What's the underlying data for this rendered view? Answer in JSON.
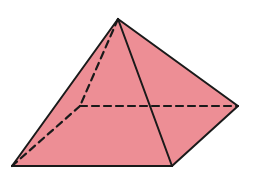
{
  "diagram": {
    "type": "square-pyramid",
    "colors": {
      "fill": "#ED8E95",
      "stroke": "#1a1a1a",
      "background": "#ffffff"
    },
    "vertices": {
      "apex": [
        118,
        19
      ],
      "front_left": [
        12,
        166
      ],
      "front_right": [
        172,
        166
      ],
      "back_right": [
        238,
        106
      ],
      "back_left_hidden": [
        80,
        106
      ]
    },
    "visible_edges": [
      [
        "apex",
        "front_left"
      ],
      [
        "apex",
        "front_right"
      ],
      [
        "apex",
        "back_right"
      ],
      [
        "front_left",
        "front_right"
      ],
      [
        "front_right",
        "back_right"
      ]
    ],
    "hidden_edges": [
      [
        "apex",
        "back_left_hidden"
      ],
      [
        "back_left_hidden",
        "front_left"
      ],
      [
        "back_left_hidden",
        "back_right"
      ]
    ]
  }
}
